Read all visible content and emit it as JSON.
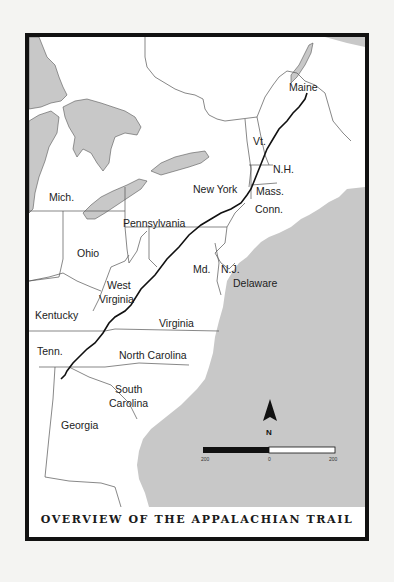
{
  "map": {
    "title": "OVERVIEW OF THE APPALACHIAN TRAIL",
    "colors": {
      "water": "#c8c8c8",
      "land": "#ffffff",
      "border": "#555555",
      "trail": "#111111",
      "frame": "#111111"
    },
    "labels": {
      "maine": "Maine",
      "vt": "Vt.",
      "nh": "N.H.",
      "mass": "Mass.",
      "conn": "Conn.",
      "new_york": "New York",
      "mich": "Mich.",
      "pennsylvania": "Pennsylvania",
      "ohio": "Ohio",
      "nj": "N.J.",
      "md": "Md.",
      "delaware": "Delaware",
      "west_virginia_1": "West",
      "west_virginia_2": "Virginia",
      "kentucky": "Kentucky",
      "virginia": "Virginia",
      "tenn": "Tenn.",
      "north_carolina": "North Carolina",
      "south_carolina_1": "South",
      "south_carolina_2": "Carolina",
      "georgia": "Georgia"
    },
    "compass": {
      "icon": "north-arrow-icon",
      "label": "N"
    },
    "scale_bar": {
      "left": "200",
      "middle": "0",
      "right": "200"
    }
  }
}
